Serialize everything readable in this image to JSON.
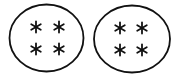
{
  "diagram": {
    "groups": [
      {
        "name": "group-1",
        "shape": "ellipse",
        "cx": 46.5,
        "cy": 38,
        "rx": 37,
        "ry": 33.5,
        "items": [
          {
            "symbol": "*",
            "x": 36,
            "y": 27
          },
          {
            "symbol": "*",
            "x": 59,
            "y": 27
          },
          {
            "symbol": "*",
            "x": 36,
            "y": 49
          },
          {
            "symbol": "*",
            "x": 59,
            "y": 49
          }
        ]
      },
      {
        "name": "group-2",
        "shape": "ellipse",
        "cx": 132,
        "cy": 39,
        "rx": 38,
        "ry": 33.5,
        "items": [
          {
            "symbol": "*",
            "x": 120,
            "y": 28
          },
          {
            "symbol": "*",
            "x": 142,
            "y": 28
          },
          {
            "symbol": "*",
            "x": 120,
            "y": 50
          },
          {
            "symbol": "*",
            "x": 142,
            "y": 50
          }
        ]
      }
    ],
    "stroke_color": "#111111",
    "background": "#ffffff"
  }
}
